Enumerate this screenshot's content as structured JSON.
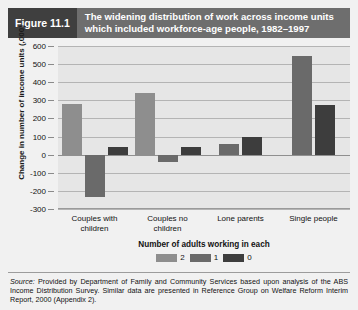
{
  "header": {
    "figure_number": "Figure 11.1",
    "title_line1": "The widening distribution of work across income units",
    "title_line2": "which included workforce-age people, 1982–1997",
    "number_bg": "#3f3f3f",
    "title_bg": "#6e6e6e"
  },
  "source_note": {
    "label": "Source:",
    "text": " Provided by Department of Family and Community Services based upon analysis of the ABS Income Distribution Survey. Similar data are presented in Reference Group on Welfare Reform Interim Report, 2000 (Appendix 2)."
  },
  "chart_data": {
    "type": "bar",
    "title": "The widening distribution of work across income units which included workforce-age people, 1982–1997",
    "xlabel": "Number of adults working in each",
    "ylabel": "Change in number of income units (,000)",
    "categories": [
      "Couples with children",
      "Couples no children",
      "Lone parents",
      "Single people"
    ],
    "category_lines": [
      [
        "Couples with",
        "children"
      ],
      [
        "Couples no",
        "children"
      ],
      [
        "Lone parents",
        ""
      ],
      [
        "Single people",
        ""
      ]
    ],
    "series": [
      {
        "name": "2",
        "color": "#8e8e8e",
        "values": [
          280,
          340,
          null,
          null
        ]
      },
      {
        "name": "1",
        "color": "#6a6a6a",
        "values": [
          -235,
          -40,
          60,
          545
        ]
      },
      {
        "name": "0",
        "color": "#3d3d3d",
        "values": [
          40,
          45,
          95,
          275
        ]
      }
    ],
    "ylim": [
      -300,
      600
    ],
    "yticks": [
      600,
      500,
      400,
      300,
      200,
      100,
      0,
      -100,
      -200,
      -300
    ],
    "ytick_labels": [
      "600",
      "500",
      "400",
      "300",
      "200",
      "100",
      "0",
      "-100",
      "-200",
      "-300"
    ],
    "grid": true,
    "legend_position": "bottom",
    "legend_title": "Number of adults working in each",
    "plot_bg": "#e6e6e6",
    "grid_color": "#b4b4b4"
  }
}
